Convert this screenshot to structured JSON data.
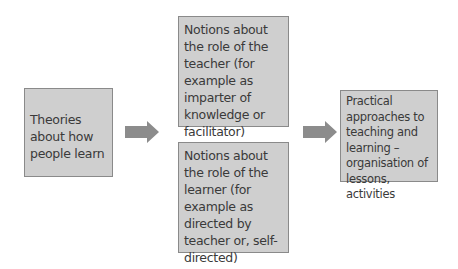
{
  "diagram": {
    "colors": {
      "box_fill": "#cfcfcf",
      "box_border": "#8a8a8a",
      "arrow": "#8c8c8c",
      "text": "#3a3a3a"
    },
    "nodes": [
      {
        "id": "theories",
        "text": "Theories about how people learn"
      },
      {
        "id": "teacher",
        "text": "Notions about the role of the teacher (for example as imparter of knowledge or facilitator)"
      },
      {
        "id": "learner",
        "text": "Notions about the role of the learner (for example as directed by teacher or, self-directed)"
      },
      {
        "id": "practical",
        "text": "Practical approaches to teaching and learning – organisation of lessons, activities"
      }
    ],
    "edges": [
      {
        "from": "theories",
        "to": "teacher+learner",
        "icon": "arrow-right-icon"
      },
      {
        "from": "teacher+learner",
        "to": "practical",
        "icon": "arrow-right-icon"
      }
    ]
  }
}
